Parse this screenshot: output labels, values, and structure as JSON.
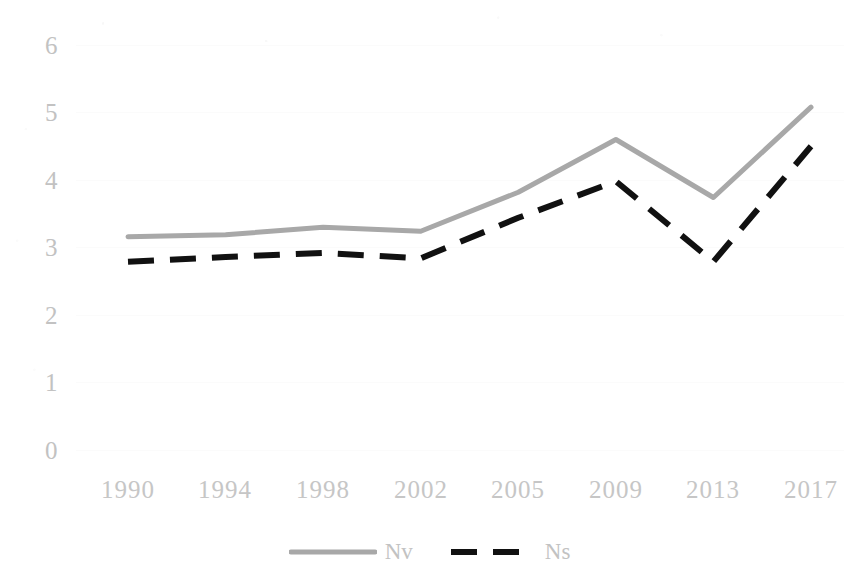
{
  "chart_data": {
    "type": "line",
    "title": "",
    "subtitle": "",
    "xlabel": "",
    "ylabel": "",
    "categories": [
      "1990",
      "1994",
      "1998",
      "2002",
      "2005",
      "2009",
      "2013",
      "2017"
    ],
    "series": [
      {
        "name": "Nv",
        "style": "solid",
        "color": "#a8a8a8",
        "values": [
          3.16,
          3.19,
          3.3,
          3.24,
          3.82,
          4.6,
          3.74,
          5.08
        ]
      },
      {
        "name": "Ns",
        "style": "dashed",
        "color": "#111111",
        "values": [
          2.79,
          2.86,
          2.92,
          2.84,
          3.44,
          3.98,
          2.79,
          4.5
        ]
      }
    ],
    "ylim": [
      0,
      6
    ],
    "y_ticks": [
      "0",
      "1",
      "2",
      "3",
      "4",
      "5",
      "6"
    ],
    "y_tick_values": [
      0,
      1,
      2,
      3,
      4,
      5,
      6
    ],
    "grid": true,
    "grid_color": "#fbfbfb",
    "legend_position": "bottom-center",
    "axis_label_color": "#c2c2c2",
    "background": "#ffffff"
  },
  "legend": {
    "entries": [
      {
        "label": "Nv",
        "marker": "solid-line-swatch"
      },
      {
        "label": "Ns",
        "marker": "dashed-line-swatch"
      }
    ]
  }
}
